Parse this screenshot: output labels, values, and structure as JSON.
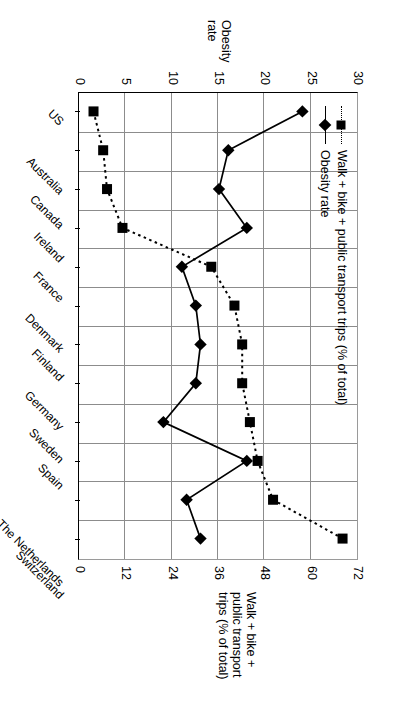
{
  "chart_data": {
    "type": "line",
    "title": "",
    "categories": [
      "US",
      "Australia",
      "Canada",
      "Ireland",
      "France",
      "Denmark",
      "Finland",
      "Germany",
      "Sweden",
      "Spain",
      "The Netherlands",
      "Switzerland"
    ],
    "series": [
      {
        "name": "Obesity rate",
        "axis": "primary",
        "marker": "diamond",
        "line_style": "solid",
        "values": [
          24,
          16,
          15,
          18,
          11,
          12.5,
          13,
          12.5,
          9,
          18,
          11.5,
          13
        ]
      },
      {
        "name": "Walk + bike + public transport trips (% of total)",
        "axis": "secondary",
        "marker": "square",
        "line_style": "dotted",
        "values": [
          3.5,
          6,
          7,
          11,
          34,
          40,
          42,
          42,
          44,
          46,
          50,
          68
        ]
      }
    ],
    "primary_axis": {
      "label_line1": "Obesity",
      "label_line2": "rate",
      "ticks": [
        0,
        5,
        10,
        15,
        20,
        25,
        30
      ],
      "lim": [
        0,
        30
      ],
      "position": "left"
    },
    "secondary_axis": {
      "label_line1": "Walk + bike +",
      "label_line2": "public transport",
      "label_line3": "trips (% of total)",
      "ticks": [
        0,
        12,
        24,
        36,
        48,
        60,
        72
      ],
      "lim": [
        0,
        72
      ],
      "position": "right"
    },
    "grid": "vertical-and-horizontal",
    "legend_position": "inside-upper-left",
    "legend": [
      {
        "label": "Obesity rate"
      },
      {
        "label": "Walk + bike + public transport trips (% of total)"
      }
    ]
  }
}
